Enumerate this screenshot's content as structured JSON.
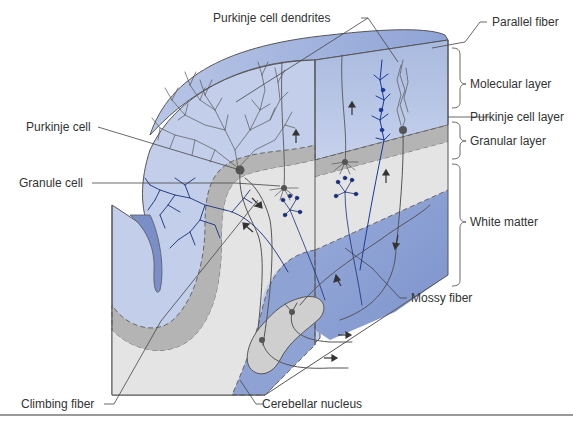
{
  "figure": {
    "colors": {
      "molecular_layer": "#c3cfea",
      "molecular_top": "#9fb1dc",
      "purkinje_layer": "#b4b4b4",
      "granular_layer": "#e4e4e4",
      "white_matter": "#8ea2d4",
      "white_matter_dark": "#7e94cc",
      "nucleus": "#cfcfcf",
      "granule_dendrite_blue": "#1a2f7a",
      "purkinje_gray": "#555555",
      "label_text": "#333333",
      "leader_line": "#444444",
      "rule": "#9a9a9a"
    },
    "labels": {
      "purkinje_cell_dendrites": "Purkinje cell dendrites",
      "parallel_fiber": "Parallel fiber",
      "molecular_layer": "Molecular layer",
      "purkinje_cell_layer": "Purkinje cell layer",
      "granular_layer": "Granular layer",
      "white_matter": "White matter",
      "purkinje_cell": "Purkinje cell",
      "granule_cell": "Granule cell",
      "mossy_fiber": "Mossy fiber",
      "climbing_fiber": "Climbing fiber",
      "cerebellar_nucleus": "Cerebellar nucleus"
    },
    "layers_right_brackets": [
      {
        "name": "Molecular layer",
        "type": "brace"
      },
      {
        "name": "Purkinje cell layer",
        "type": "line"
      },
      {
        "name": "Granular layer",
        "type": "brace"
      },
      {
        "name": "White matter",
        "type": "brace"
      }
    ]
  }
}
